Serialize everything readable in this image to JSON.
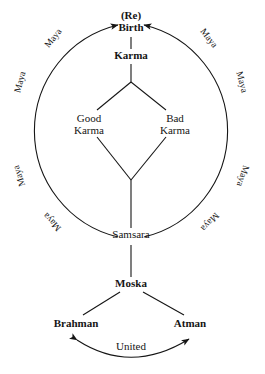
{
  "diagram": {
    "background_color": "#ffffff",
    "line_color": "#151515",
    "text_color": "#151515",
    "nodes": {
      "rebirth_prefix": "(Re)",
      "rebirth": "Birth",
      "karma": "Karma",
      "good_karma_line1": "Good",
      "good_karma_line2": "Karma",
      "bad_karma_line1": "Bad",
      "bad_karma_line2": "Karma",
      "samsara": "Samsara",
      "moska": "Moska",
      "brahman": "Brahman",
      "atman": "Atman",
      "united": "United"
    },
    "cycle_labels": [
      {
        "text": "Maya",
        "position": "upper-left-outer",
        "rotation": -52
      },
      {
        "text": "Maya",
        "position": "upper-left-inner",
        "rotation": -75
      },
      {
        "text": "Maya",
        "position": "lower-left-upper",
        "rotation": -108
      },
      {
        "text": "Maya",
        "position": "lower-left-lower",
        "rotation": -133
      },
      {
        "text": "Maya",
        "position": "upper-right-outer",
        "rotation": 52
      },
      {
        "text": "Maya",
        "position": "upper-right-inner",
        "rotation": 75
      },
      {
        "text": "Maya",
        "position": "lower-right-upper",
        "rotation": 108
      },
      {
        "text": "Maya",
        "position": "lower-right-lower",
        "rotation": 133
      }
    ]
  }
}
